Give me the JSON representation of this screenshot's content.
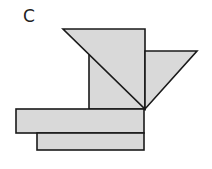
{
  "figure": {
    "label": "C",
    "fill": "#d9d9d9",
    "stroke": "#1a1a1a",
    "shapes": [
      {
        "name": "top-triangle",
        "type": "polygon",
        "points": "63,29 145,29 145,109"
      },
      {
        "name": "middle-square",
        "type": "polygon",
        "points": "89,55 145,55 145,109 89,109"
      },
      {
        "name": "right-triangle",
        "type": "polygon",
        "points": "145,51 197,51 145,109"
      },
      {
        "name": "upper-bar",
        "type": "rect",
        "x": 16,
        "y": 109,
        "w": 128,
        "h": 24
      },
      {
        "name": "lower-bar",
        "type": "rect",
        "x": 37,
        "y": 133,
        "w": 107,
        "h": 17
      }
    ]
  }
}
